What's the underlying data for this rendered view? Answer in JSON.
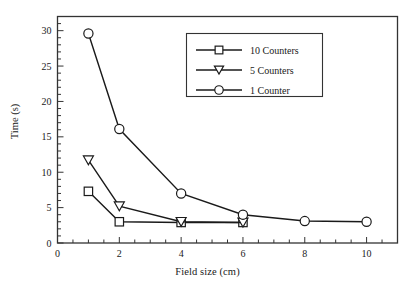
{
  "chart_data": {
    "type": "line",
    "title": "",
    "xlabel": "Field size (cm)",
    "ylabel": "Time (s)",
    "xlim": [
      0,
      11
    ],
    "ylim": [
      0,
      32
    ],
    "xticks": [
      0,
      2,
      4,
      6,
      8,
      10
    ],
    "xticklabels": [
      "0",
      "2",
      "4",
      "6",
      "8",
      "10"
    ],
    "xminorstep": 0.5,
    "yticks": [
      0,
      5,
      10,
      15,
      20,
      25,
      30
    ],
    "yticklabels": [
      "0",
      "5",
      "10",
      "15",
      "20",
      "25",
      "30"
    ],
    "yminorstep": 1,
    "grid": false,
    "legend_position": "upper center",
    "frame": true,
    "series": [
      {
        "name": "10 Counters",
        "marker": "square",
        "x": [
          1,
          2,
          4,
          6
        ],
        "values": [
          7.3,
          3.0,
          2.9,
          2.9
        ]
      },
      {
        "name": "5 Counters",
        "marker": "triangle-down",
        "x": [
          1,
          2,
          4,
          6
        ],
        "values": [
          11.7,
          5.2,
          3.0,
          2.9
        ]
      },
      {
        "name": "1 Counter",
        "marker": "circle",
        "x": [
          1,
          2,
          4,
          6,
          8,
          10
        ],
        "values": [
          29.6,
          16.1,
          7.0,
          4.0,
          3.1,
          3.0
        ]
      }
    ]
  },
  "legend": {
    "entries": [
      {
        "label": "10 Counters",
        "marker": "square"
      },
      {
        "label": "5 Counters",
        "marker": "triangle-down"
      },
      {
        "label": "1 Counter",
        "marker": "circle"
      }
    ]
  },
  "style": {
    "line_color": "#1a1a1a",
    "marker_face": "#ffffff",
    "background": "#ffffff",
    "axis_color": "#333333"
  }
}
